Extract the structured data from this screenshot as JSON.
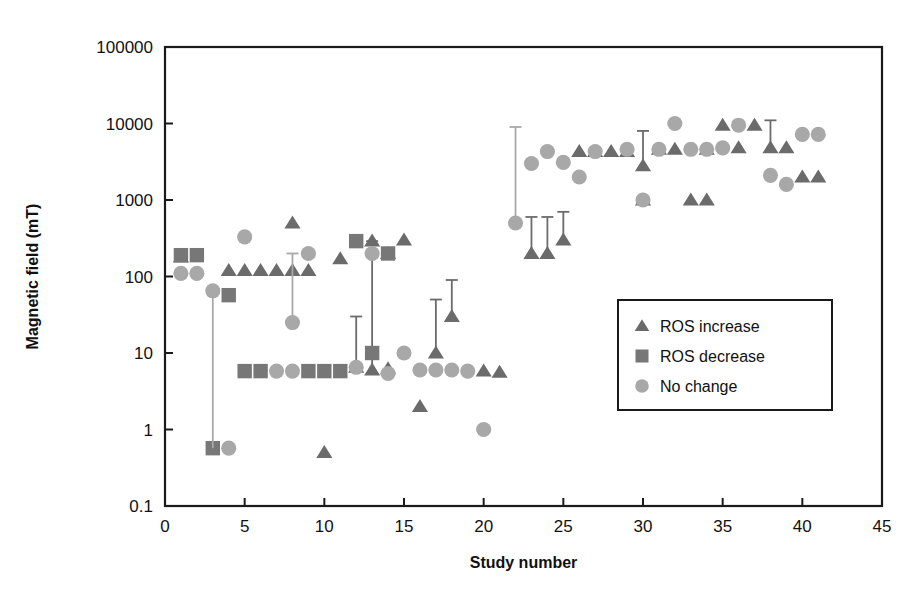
{
  "chart_data": {
    "type": "scatter",
    "title": "",
    "xlabel": "Study number",
    "ylabel": "Magnetic field (mT)",
    "xlim": [
      0,
      45
    ],
    "ylim": [
      0.1,
      100000
    ],
    "yscale": "log",
    "grid": false,
    "x_ticks": [
      0,
      5,
      10,
      15,
      20,
      25,
      30,
      35,
      40,
      45
    ],
    "y_ticks": [
      0.1,
      1,
      10,
      100,
      1000,
      10000,
      100000
    ],
    "y_tick_labels": [
      "0.1",
      "1",
      "10",
      "100",
      "1000",
      "10000",
      "100000"
    ],
    "x_tick_labels": [
      "0",
      "5",
      "10",
      "15",
      "20",
      "25",
      "30",
      "35",
      "40",
      "45"
    ],
    "legend_position": "center-right",
    "legend": [
      {
        "label": "ROS increase",
        "marker": "triangle",
        "color": "#6b6b6b"
      },
      {
        "label": "ROS decrease",
        "marker": "square",
        "color": "#777777"
      },
      {
        "label": "No change",
        "marker": "circle",
        "color": "#a8a8a8"
      }
    ],
    "series": [
      {
        "name": "ROS increase",
        "marker": "triangle",
        "color": "#6b6b6b",
        "points": [
          {
            "x": 1,
            "y": 180
          },
          {
            "x": 4,
            "y": 120
          },
          {
            "x": 5,
            "y": 120
          },
          {
            "x": 6,
            "y": 120
          },
          {
            "x": 7,
            "y": 120
          },
          {
            "x": 8,
            "y": 500
          },
          {
            "x": 8,
            "y": 120
          },
          {
            "x": 9,
            "y": 120
          },
          {
            "x": 10,
            "y": 0.5
          },
          {
            "x": 11,
            "y": 170
          },
          {
            "x": 12,
            "y": 6.5,
            "yerr_high": 30
          },
          {
            "x": 13,
            "y": 6.0,
            "yerr_high": 290
          },
          {
            "x": 13,
            "y": 290
          },
          {
            "x": 14,
            "y": 200
          },
          {
            "x": 14,
            "y": 6.2
          },
          {
            "x": 15,
            "y": 300
          },
          {
            "x": 16,
            "y": 2.0
          },
          {
            "x": 17,
            "y": 10,
            "yerr_high": 50
          },
          {
            "x": 18,
            "y": 30,
            "yerr_high": 90
          },
          {
            "x": 20,
            "y": 5.8
          },
          {
            "x": 21,
            "y": 5.6
          },
          {
            "x": 23,
            "y": 200,
            "yerr_high": 600
          },
          {
            "x": 24,
            "y": 200,
            "yerr_high": 600
          },
          {
            "x": 25,
            "y": 300,
            "yerr_high": 700
          },
          {
            "x": 26,
            "y": 4300
          },
          {
            "x": 27,
            "y": 4300
          },
          {
            "x": 28,
            "y": 4300
          },
          {
            "x": 29,
            "y": 4300
          },
          {
            "x": 30,
            "y": 2800,
            "yerr_high": 8000
          },
          {
            "x": 30,
            "y": 1000
          },
          {
            "x": 31,
            "y": 4600
          },
          {
            "x": 32,
            "y": 4600
          },
          {
            "x": 33,
            "y": 1000
          },
          {
            "x": 34,
            "y": 1000
          },
          {
            "x": 34,
            "y": 4600
          },
          {
            "x": 35,
            "y": 9500
          },
          {
            "x": 36,
            "y": 4800
          },
          {
            "x": 37,
            "y": 9500
          },
          {
            "x": 38,
            "y": 4800,
            "yerr_high": 11000
          },
          {
            "x": 39,
            "y": 4800
          },
          {
            "x": 40,
            "y": 2000
          },
          {
            "x": 41,
            "y": 2000
          }
        ]
      },
      {
        "name": "ROS decrease",
        "marker": "square",
        "color": "#777777",
        "points": [
          {
            "x": 1,
            "y": 190
          },
          {
            "x": 2,
            "y": 190
          },
          {
            "x": 3,
            "y": 0.57
          },
          {
            "x": 4,
            "y": 57
          },
          {
            "x": 5,
            "y": 5.8
          },
          {
            "x": 6,
            "y": 5.8
          },
          {
            "x": 9,
            "y": 5.8
          },
          {
            "x": 10,
            "y": 5.8
          },
          {
            "x": 11,
            "y": 5.8
          },
          {
            "x": 12,
            "y": 290
          },
          {
            "x": 13,
            "y": 10
          },
          {
            "x": 14,
            "y": 200
          }
        ]
      },
      {
        "name": "No change",
        "marker": "circle",
        "color": "#a8a8a8",
        "points": [
          {
            "x": 1,
            "y": 110
          },
          {
            "x": 2,
            "y": 110
          },
          {
            "x": 3,
            "y": 65,
            "yerr_low": 0.57
          },
          {
            "x": 4,
            "y": 0.57
          },
          {
            "x": 5,
            "y": 330
          },
          {
            "x": 7,
            "y": 5.8
          },
          {
            "x": 8,
            "y": 5.8
          },
          {
            "x": 8,
            "y": 25,
            "yerr_high": 200
          },
          {
            "x": 9,
            "y": 200
          },
          {
            "x": 12,
            "y": 6.5
          },
          {
            "x": 13,
            "y": 200
          },
          {
            "x": 14,
            "y": 5.4
          },
          {
            "x": 15,
            "y": 10
          },
          {
            "x": 16,
            "y": 6.0
          },
          {
            "x": 17,
            "y": 6.0
          },
          {
            "x": 18,
            "y": 6.0
          },
          {
            "x": 19,
            "y": 5.8
          },
          {
            "x": 20,
            "y": 1.0
          },
          {
            "x": 22,
            "y": 500,
            "yerr_high": 9000
          },
          {
            "x": 23,
            "y": 3000
          },
          {
            "x": 24,
            "y": 4300
          },
          {
            "x": 25,
            "y": 3100
          },
          {
            "x": 26,
            "y": 2000
          },
          {
            "x": 27,
            "y": 4300
          },
          {
            "x": 29,
            "y": 4600
          },
          {
            "x": 30,
            "y": 1000
          },
          {
            "x": 31,
            "y": 4600
          },
          {
            "x": 32,
            "y": 10000
          },
          {
            "x": 33,
            "y": 4600
          },
          {
            "x": 34,
            "y": 4600
          },
          {
            "x": 35,
            "y": 4800
          },
          {
            "x": 36,
            "y": 9500
          },
          {
            "x": 38,
            "y": 2100
          },
          {
            "x": 39,
            "y": 1600
          },
          {
            "x": 40,
            "y": 7200
          },
          {
            "x": 41,
            "y": 7200
          }
        ]
      }
    ]
  }
}
